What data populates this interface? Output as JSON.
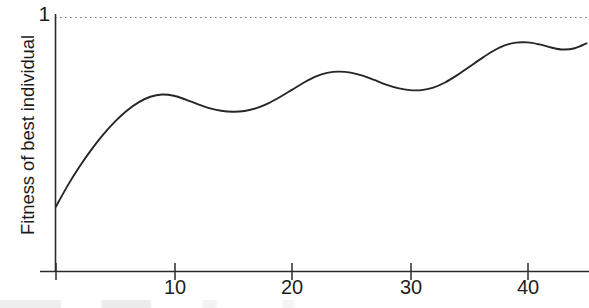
{
  "chart_data": {
    "type": "line",
    "title": "",
    "xlabel": "",
    "ylabel": "Fitness of best individual",
    "xlim": [
      0,
      45.2
    ],
    "ylim": [
      0.0,
      1.0
    ],
    "x_ticks": [
      10,
      20,
      30,
      40
    ],
    "x_tick_labels": [
      "10",
      "20",
      "30",
      "40"
    ],
    "y_ticks": [
      1
    ],
    "y_tick_labels": [
      "1"
    ],
    "grid": false,
    "legend": null,
    "annotations": [
      {
        "name": "target-fitness-line",
        "type": "horizontal-dotted-line",
        "y": 1.0,
        "label": "1"
      }
    ],
    "series": [
      {
        "name": "best-individual-fitness",
        "color": "#262626",
        "x": [
          0,
          1,
          2,
          3,
          4,
          5,
          6,
          7,
          8,
          9,
          10,
          11,
          12,
          13,
          14,
          15,
          16,
          17,
          18,
          19,
          20,
          21,
          22,
          23,
          24,
          25,
          26,
          27,
          28,
          29,
          30,
          31,
          32,
          33,
          34,
          35,
          36,
          37,
          38,
          39,
          40,
          41,
          42,
          43,
          44,
          45
        ],
        "y": [
          0.256,
          0.339,
          0.413,
          0.48,
          0.539,
          0.59,
          0.633,
          0.666,
          0.688,
          0.697,
          0.692,
          0.677,
          0.659,
          0.643,
          0.633,
          0.629,
          0.632,
          0.643,
          0.662,
          0.687,
          0.715,
          0.743,
          0.767,
          0.782,
          0.787,
          0.783,
          0.771,
          0.754,
          0.736,
          0.722,
          0.714,
          0.714,
          0.724,
          0.744,
          0.772,
          0.804,
          0.836,
          0.866,
          0.889,
          0.901,
          0.902,
          0.894,
          0.882,
          0.874,
          0.879,
          0.898
        ]
      }
    ]
  },
  "axis": {
    "y_top_value": "1",
    "y_title": "Fitness of best individual",
    "x_tick_labels": [
      "10",
      "20",
      "30",
      "40"
    ]
  },
  "colors": {
    "curve": "#262626",
    "axis": "#2b2b2b",
    "dotted": "#777777",
    "background": "#ffffff"
  }
}
